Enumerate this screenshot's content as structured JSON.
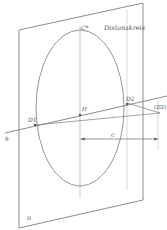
{
  "diagram": {
    "type": "perspective-construction",
    "colors": {
      "line": "#6e6e6e",
      "curve": "#7a7a7a",
      "thin": "#9a9a9a",
      "text": "#555555",
      "background": "#ffffff"
    },
    "labels": {
      "distance_circle": "Distanzkreis",
      "c_star": "C*",
      "principal_point": "H",
      "d1": "D1",
      "d2": "D2",
      "d2_far": "(D2)",
      "horizon": "h",
      "distance": "c",
      "picture_plane": "π"
    }
  }
}
